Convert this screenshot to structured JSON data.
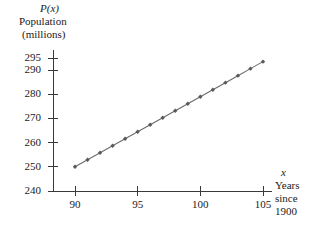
{
  "figure": {
    "function_label": "P(x)",
    "y_axis_title_line1": "Population",
    "y_axis_title_line2": "(millions)",
    "x_var_label": "x",
    "x_axis_title_line1": "Years",
    "x_axis_title_line2": "since",
    "x_axis_title_line3": "1900"
  },
  "chart_data": {
    "type": "line",
    "title": "",
    "xlabel": "Years since 1900",
    "ylabel": "Population (millions)",
    "function_name": "P(x)",
    "xlim": [
      88.6,
      106.5
    ],
    "ylim": [
      240,
      297
    ],
    "grid": false,
    "legend": null,
    "marker": "diamond",
    "line_color": "#6b6b6b",
    "marker_color": "#5a5a5a",
    "x_ticks": [
      90,
      95,
      100,
      105
    ],
    "y_ticks": [
      240,
      250,
      260,
      270,
      280,
      290,
      295
    ],
    "x_tick_labels": [
      "90",
      "95",
      "100",
      "105"
    ],
    "y_tick_labels": [
      "240",
      "250",
      "260",
      "270",
      "280",
      "290",
      "295"
    ],
    "x": [
      90,
      91,
      92,
      93,
      94,
      95,
      96,
      97,
      98,
      99,
      100,
      101,
      102,
      103,
      104,
      105
    ],
    "values": [
      250,
      252.9,
      255.8,
      258.7,
      261.6,
      264.5,
      267.4,
      270.3,
      273.2,
      276.1,
      279.0,
      281.9,
      284.8,
      287.7,
      290.6,
      293.5
    ],
    "series": [
      {
        "name": "Population",
        "values": [
          250,
          252.9,
          255.8,
          258.7,
          261.6,
          264.5,
          267.4,
          270.3,
          273.2,
          276.1,
          279.0,
          281.9,
          284.8,
          287.7,
          290.6,
          293.5
        ]
      }
    ]
  },
  "geometry": {
    "axis_x_px": 53,
    "axis_y_px": 191,
    "plot_right_px": 272,
    "plot_top_px": 50,
    "x_min_px": 75,
    "x_max_px": 263,
    "y_240_px": 191,
    "y_295_px": 58
  }
}
